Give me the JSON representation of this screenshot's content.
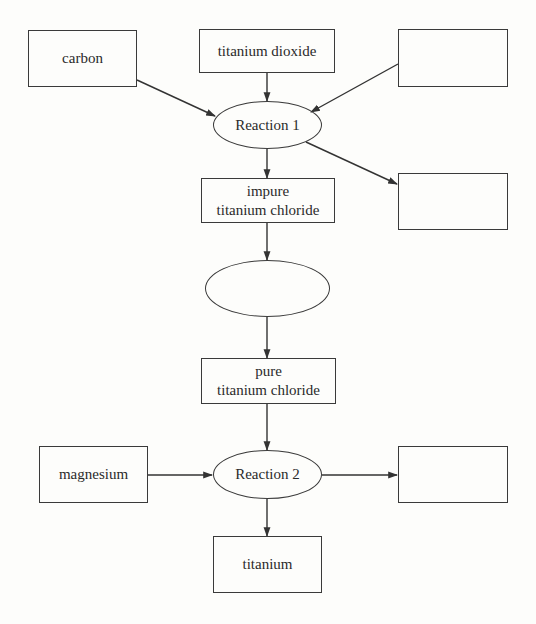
{
  "diagram": {
    "nodes": {
      "carbon": {
        "label": "carbon",
        "shape": "box",
        "blank": false
      },
      "titanium_dioxide": {
        "label": "titanium dioxide",
        "shape": "box",
        "blank": false
      },
      "input_blank": {
        "label": "",
        "shape": "box",
        "blank": true
      },
      "reaction1": {
        "label": "Reaction 1",
        "shape": "ellipse",
        "blank": false
      },
      "output1_blank": {
        "label": "",
        "shape": "box",
        "blank": true
      },
      "impure_tc": {
        "label": "impure\ntitanium chloride",
        "shape": "box",
        "blank": false
      },
      "process_blank": {
        "label": "",
        "shape": "ellipse",
        "blank": true
      },
      "pure_tc": {
        "label": "pure\ntitanium chloride",
        "shape": "box",
        "blank": false
      },
      "magnesium": {
        "label": "magnesium",
        "shape": "box",
        "blank": false
      },
      "reaction2": {
        "label": "Reaction 2",
        "shape": "ellipse",
        "blank": false
      },
      "output2_blank": {
        "label": "",
        "shape": "box",
        "blank": true
      },
      "titanium": {
        "label": "titanium",
        "shape": "box",
        "blank": false
      }
    },
    "edges": [
      {
        "from": "carbon",
        "to": "reaction1"
      },
      {
        "from": "titanium_dioxide",
        "to": "reaction1"
      },
      {
        "from": "input_blank",
        "to": "reaction1"
      },
      {
        "from": "reaction1",
        "to": "impure_tc"
      },
      {
        "from": "reaction1",
        "to": "output1_blank"
      },
      {
        "from": "impure_tc",
        "to": "process_blank"
      },
      {
        "from": "process_blank",
        "to": "pure_tc"
      },
      {
        "from": "pure_tc",
        "to": "reaction2"
      },
      {
        "from": "magnesium",
        "to": "reaction2"
      },
      {
        "from": "reaction2",
        "to": "output2_blank"
      },
      {
        "from": "reaction2",
        "to": "titanium"
      }
    ],
    "colors": {
      "stroke": "#3a3a3a",
      "text": "#2a2a2a",
      "background": "#fdfdfb"
    }
  }
}
